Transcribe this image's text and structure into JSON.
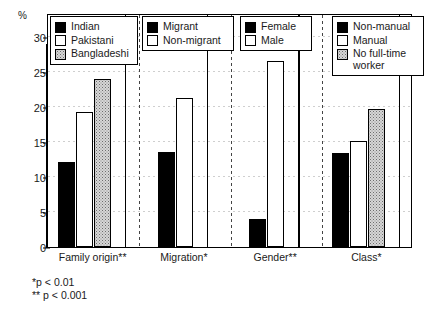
{
  "axis": {
    "unit_label": "%",
    "y_ticks": [
      0,
      5,
      10,
      15,
      20,
      25,
      30
    ],
    "y_min": 0,
    "y_max": 33.5
  },
  "footnotes": {
    "line1": "*p < 0.01",
    "line2": "** p < 0.001"
  },
  "legends": [
    {
      "name": "family-origin",
      "items": [
        {
          "label": "Indian",
          "fill": "solid"
        },
        {
          "label": "Pakistani",
          "fill": "open"
        },
        {
          "label": "Bangladeshi",
          "fill": "dotted"
        }
      ]
    },
    {
      "name": "migration",
      "items": [
        {
          "label": "Migrant",
          "fill": "solid"
        },
        {
          "label": "Non-migrant",
          "fill": "open"
        }
      ]
    },
    {
      "name": "gender",
      "items": [
        {
          "label": "Female",
          "fill": "solid"
        },
        {
          "label": "Male",
          "fill": "open"
        }
      ]
    },
    {
      "name": "class",
      "items": [
        {
          "label": "Non-manual",
          "fill": "solid"
        },
        {
          "label": "Manual",
          "fill": "open"
        },
        {
          "label": "No full-time\nworker",
          "fill": "dotted"
        }
      ]
    }
  ],
  "chart_data": {
    "type": "bar",
    "title": "",
    "xlabel": "",
    "ylabel": "%",
    "ylim": [
      0,
      33.5
    ],
    "yticks": [
      0,
      5,
      10,
      15,
      20,
      25,
      30
    ],
    "grid": true,
    "legend_position": "inside-top",
    "categories": [
      "Family origin**",
      "Migration*",
      "Gender**",
      "Class*"
    ],
    "groups": [
      {
        "category": "Family origin**",
        "significance": "**",
        "bars": [
          {
            "name": "Indian",
            "value": 12.1,
            "fill": "solid"
          },
          {
            "name": "Pakistani",
            "value": 19.4,
            "fill": "open"
          },
          {
            "name": "Bangladeshi",
            "value": 24.1,
            "fill": "dotted"
          }
        ]
      },
      {
        "category": "Migration*",
        "significance": "*",
        "bars": [
          {
            "name": "Migrant",
            "value": 13.6,
            "fill": "solid"
          },
          {
            "name": "Non-migrant",
            "value": 21.3,
            "fill": "open"
          }
        ]
      },
      {
        "category": "Gender**",
        "significance": "**",
        "bars": [
          {
            "name": "Female",
            "value": 4.0,
            "fill": "solid"
          },
          {
            "name": "Male",
            "value": 26.7,
            "fill": "open"
          }
        ]
      },
      {
        "category": "Class*",
        "significance": "*",
        "bars": [
          {
            "name": "Non-manual",
            "value": 13.5,
            "fill": "solid"
          },
          {
            "name": "Manual",
            "value": 15.2,
            "fill": "open"
          },
          {
            "name": "No full-time worker",
            "value": 19.8,
            "fill": "dotted"
          }
        ]
      }
    ]
  }
}
